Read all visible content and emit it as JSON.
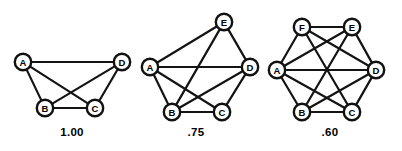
{
  "figure": {
    "caption_labels": [
      "1.00",
      ".75",
      ".60"
    ],
    "background_color": "#ffffff",
    "line_color": "#141414",
    "node_fill": "#ffffff",
    "node_stroke": "#111111"
  },
  "chart_data": {
    "type": "diagram",
    "title": "",
    "subtitle": "",
    "xlabel": "",
    "ylabel": "",
    "legend": [],
    "graphs": [
      {
        "id": "graph-1",
        "density_label": "1.00",
        "density_value": 1.0,
        "node_count": 4,
        "edge_count": 6,
        "nodes": [
          {
            "id": "A",
            "label": "A",
            "x": 23,
            "y": 62
          },
          {
            "id": "B",
            "label": "B",
            "x": 45,
            "y": 108
          },
          {
            "id": "C",
            "label": "C",
            "x": 95,
            "y": 108
          },
          {
            "id": "D",
            "label": "D",
            "x": 122,
            "y": 62
          }
        ],
        "edges": [
          [
            "A",
            "B"
          ],
          [
            "A",
            "C"
          ],
          [
            "A",
            "D"
          ],
          [
            "B",
            "C"
          ],
          [
            "B",
            "D"
          ],
          [
            "C",
            "D"
          ]
        ],
        "label_x": 72,
        "label_y": 136
      },
      {
        "id": "graph-2",
        "density_label": ".75",
        "density_value": 0.75,
        "node_count": 5,
        "edge_count": 9,
        "nodes": [
          {
            "id": "A",
            "label": "A",
            "x": 150,
            "y": 67
          },
          {
            "id": "B",
            "label": "B",
            "x": 172,
            "y": 112
          },
          {
            "id": "C",
            "label": "C",
            "x": 222,
            "y": 112
          },
          {
            "id": "D",
            "label": "D",
            "x": 250,
            "y": 67
          },
          {
            "id": "E",
            "label": "E",
            "x": 224,
            "y": 22
          }
        ],
        "edges": [
          [
            "A",
            "B"
          ],
          [
            "A",
            "C"
          ],
          [
            "A",
            "D"
          ],
          [
            "A",
            "E"
          ],
          [
            "B",
            "C"
          ],
          [
            "B",
            "D"
          ],
          [
            "B",
            "E"
          ],
          [
            "C",
            "D"
          ],
          [
            "D",
            "E"
          ]
        ],
        "label_x": 196,
        "label_y": 136
      },
      {
        "id": "graph-3",
        "density_label": ".60",
        "density_value": 0.6,
        "node_count": 6,
        "edge_count": 13,
        "nodes": [
          {
            "id": "A",
            "label": "A",
            "x": 277,
            "y": 70
          },
          {
            "id": "B",
            "label": "B",
            "x": 302,
            "y": 112
          },
          {
            "id": "C",
            "label": "C",
            "x": 352,
            "y": 112
          },
          {
            "id": "D",
            "label": "D",
            "x": 376,
            "y": 70
          },
          {
            "id": "E",
            "label": "E",
            "x": 352,
            "y": 27
          },
          {
            "id": "F",
            "label": "F",
            "x": 302,
            "y": 27
          }
        ],
        "edges": [
          [
            "A",
            "B"
          ],
          [
            "A",
            "C"
          ],
          [
            "A",
            "D"
          ],
          [
            "A",
            "E"
          ],
          [
            "A",
            "F"
          ],
          [
            "B",
            "C"
          ],
          [
            "B",
            "D"
          ],
          [
            "B",
            "E"
          ],
          [
            "C",
            "D"
          ],
          [
            "C",
            "F"
          ],
          [
            "D",
            "E"
          ],
          [
            "D",
            "F"
          ],
          [
            "E",
            "F"
          ]
        ],
        "label_x": 330,
        "label_y": 136
      }
    ]
  }
}
